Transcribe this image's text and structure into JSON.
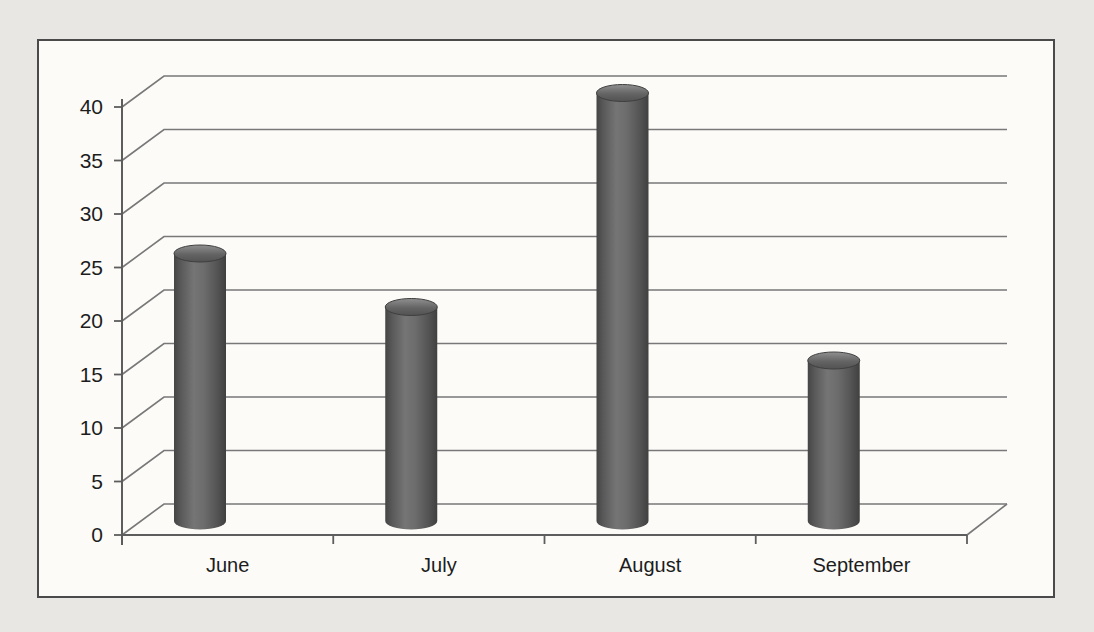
{
  "page": {
    "background_color": "#e8e7e3"
  },
  "chart_data": {
    "type": "bar",
    "subtype": "3d-cylinder",
    "title": "",
    "xlabel": "",
    "ylabel": "",
    "categories": [
      "June",
      "July",
      "August",
      "September"
    ],
    "values": [
      25,
      20,
      40,
      15
    ],
    "series": [
      {
        "name": "",
        "values": [
          25,
          20,
          40,
          15
        ]
      }
    ],
    "ylim": [
      0,
      40
    ],
    "ytick_step": 5,
    "yticks": [
      0,
      5,
      10,
      15,
      20,
      25,
      30,
      35,
      40
    ],
    "grid": true,
    "legend": false,
    "colors": {
      "bar_edge": "#454545",
      "bar_mid": "#757575",
      "bar_top_light": "#909090",
      "bar_top_dark": "#525252",
      "bar_top_rim": "#3f3f3f",
      "gridline": "#787878",
      "axis": "#5d5d5d",
      "text": "#1d1d1d",
      "plot_background": "#fcfbf8",
      "frame_border": "#4a4a4a"
    }
  }
}
